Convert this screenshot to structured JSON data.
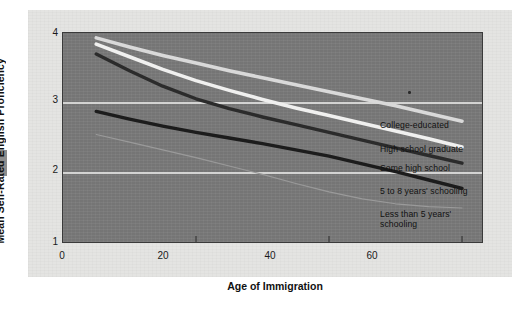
{
  "chart_data": {
    "type": "line",
    "title": "",
    "xlabel": "Age of Immigration",
    "ylabel": "Mean Self-Rated English Proficiency",
    "xlim": [
      0,
      63
    ],
    "ylim": [
      1,
      4
    ],
    "xticks": [
      0,
      20,
      40,
      60
    ],
    "yticks": [
      1,
      2,
      3,
      4
    ],
    "xtick_labels": [
      "0",
      "20",
      "40",
      "60"
    ],
    "ytick_labels": [
      "1",
      "2",
      "3",
      "4"
    ],
    "grid": "horizontal gridlines at y = 2 and y = 3 (white)",
    "legend_position": "right of plot, inline at line ends",
    "plot_background": "#797979",
    "series": [
      {
        "name": "College-educated",
        "color": "#d9d9d9",
        "x": [
          5,
          10,
          15,
          20,
          25,
          30,
          35,
          40,
          45,
          50,
          55,
          60
        ],
        "y": [
          3.93,
          3.8,
          3.68,
          3.57,
          3.46,
          3.36,
          3.26,
          3.16,
          3.06,
          2.96,
          2.85,
          2.74
        ]
      },
      {
        "name": "High school graduate",
        "color": "#f0f0ef",
        "x": [
          5,
          10,
          15,
          20,
          25,
          30,
          35,
          40,
          45,
          50,
          55,
          60
        ],
        "y": [
          3.84,
          3.66,
          3.48,
          3.32,
          3.18,
          3.05,
          2.93,
          2.82,
          2.71,
          2.6,
          2.49,
          2.37
        ]
      },
      {
        "name": "Some high school",
        "color": "#2b2b2b",
        "x": [
          5,
          10,
          15,
          20,
          25,
          30,
          35,
          40,
          45,
          50,
          55,
          60
        ],
        "y": [
          3.7,
          3.46,
          3.24,
          3.06,
          2.92,
          2.8,
          2.69,
          2.58,
          2.47,
          2.36,
          2.25,
          2.14
        ]
      },
      {
        "name": "5 to 8 years' schooling",
        "color": "#1c1c1c",
        "x": [
          5,
          10,
          15,
          20,
          25,
          30,
          35,
          40,
          45,
          50,
          55,
          60
        ],
        "y": [
          2.88,
          2.77,
          2.67,
          2.58,
          2.5,
          2.42,
          2.33,
          2.24,
          2.13,
          2.02,
          1.9,
          1.78
        ]
      },
      {
        "name": "Less than 5 years' schooling",
        "color": "#9a9a9a",
        "x": [
          5,
          10,
          15,
          20,
          25,
          30,
          35,
          40,
          45,
          50,
          55,
          60
        ],
        "y": [
          2.55,
          2.44,
          2.33,
          2.22,
          2.1,
          1.98,
          1.85,
          1.73,
          1.63,
          1.56,
          1.52,
          1.5
        ]
      }
    ]
  },
  "legend": [
    {
      "label": "College-educated"
    },
    {
      "label": "High school graduate"
    },
    {
      "label": "Some high school"
    },
    {
      "label": "5 to 8 years' schooling"
    },
    {
      "label": "Less than 5 years'\nschooling"
    }
  ]
}
